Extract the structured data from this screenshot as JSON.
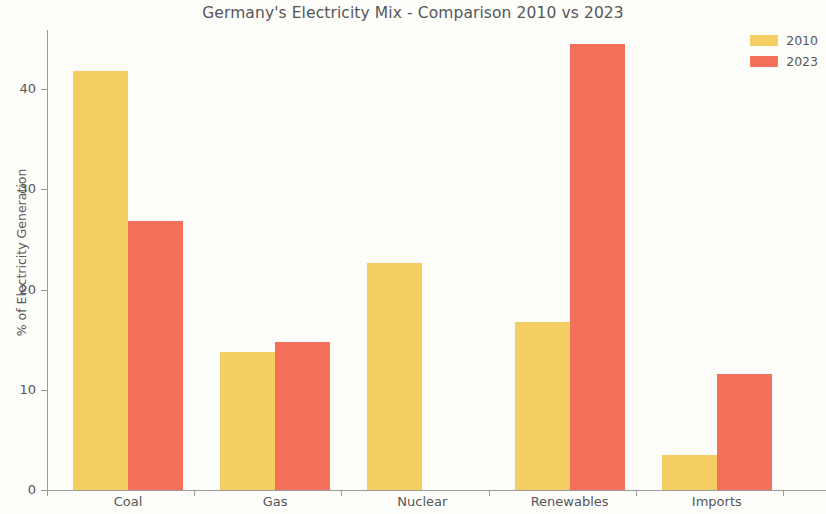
{
  "chart_data": {
    "type": "bar",
    "title": "Germany's Electricity Mix - Comparison 2010 vs 2023",
    "xlabel": "",
    "ylabel": "% of Electricity Generation",
    "categories": [
      "Coal",
      "Gas",
      "Nuclear",
      "Renewables",
      "Imports"
    ],
    "series": [
      {
        "name": "2010",
        "color": "#f5ce63",
        "values": [
          41.8,
          13.8,
          22.6,
          16.8,
          3.5
        ]
      },
      {
        "name": "2023",
        "color": "#f5705a",
        "values": [
          26.8,
          14.8,
          0.0,
          44.5,
          11.6
        ]
      }
    ],
    "ylim": [
      0,
      46
    ],
    "yticks": [
      0,
      10,
      20,
      30,
      40
    ],
    "ytick_labels": [
      "0",
      "10",
      "20",
      "30",
      "40"
    ],
    "grid": false,
    "legend_position": "top-right"
  },
  "legend": {
    "entries": [
      {
        "label": "2010",
        "color": "#f5ce63"
      },
      {
        "label": "2023",
        "color": "#f5705a"
      }
    ]
  },
  "style": {
    "background": "#fdfdfa",
    "axis_color": "#9a9a9e",
    "text_color": "#56565a"
  }
}
